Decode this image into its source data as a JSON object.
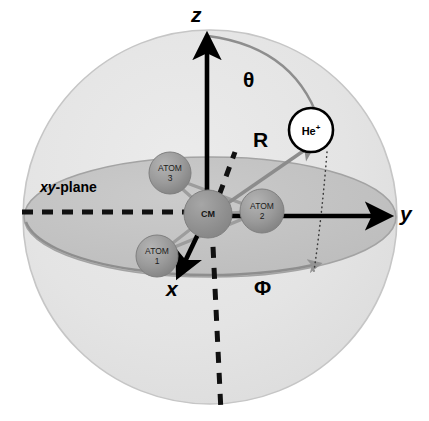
{
  "figure": {
    "background_color": "#ffffff"
  },
  "colors": {
    "sphere_fill": "#e2e2e2",
    "sphere_stroke": "#c9c9c9",
    "plane_fill": "#c0c0c0",
    "plane_stroke": "#9e9e9e",
    "atom_fill": "#9a9a9a",
    "atom_stroke": "#7d7d7d",
    "cm_fill": "#8e8e8e",
    "bond_color": "#9a9a9a",
    "axis_color": "#000000",
    "arc_color": "#8c8c8c",
    "vector_color": "#8c8c8c",
    "dashed_color": "#111111",
    "ion_fill": "#ffffff",
    "ion_stroke": "#000000"
  },
  "axes": [
    {
      "name": "z-axis",
      "label": "z",
      "direction": "up"
    },
    {
      "name": "y-axis",
      "label": "y",
      "direction": "right"
    },
    {
      "name": "x-axis",
      "label": "x",
      "direction": "down-left"
    }
  ],
  "angles": [
    {
      "name": "polar-angle",
      "label": "θ",
      "description": "polar angle measured from z-axis to R"
    },
    {
      "name": "azimuthal-angle",
      "label": "Φ",
      "description": "azimuthal angle measured in xy-plane"
    }
  ],
  "vectors": [
    {
      "name": "position-vector",
      "label": "R",
      "from": "CM",
      "to": "He+"
    }
  ],
  "plane": {
    "label_prefix": "xy",
    "label_suffix": "-plane"
  },
  "atoms": [
    {
      "id": "atom-1",
      "line1": "ATOM",
      "line2": "1"
    },
    {
      "id": "atom-2",
      "line1": "ATOM",
      "line2": "2"
    },
    {
      "id": "atom-3",
      "line1": "ATOM",
      "line2": "3"
    }
  ],
  "center_of_mass": {
    "label": "CM"
  },
  "ion": {
    "symbol": "He",
    "charge": "+"
  }
}
